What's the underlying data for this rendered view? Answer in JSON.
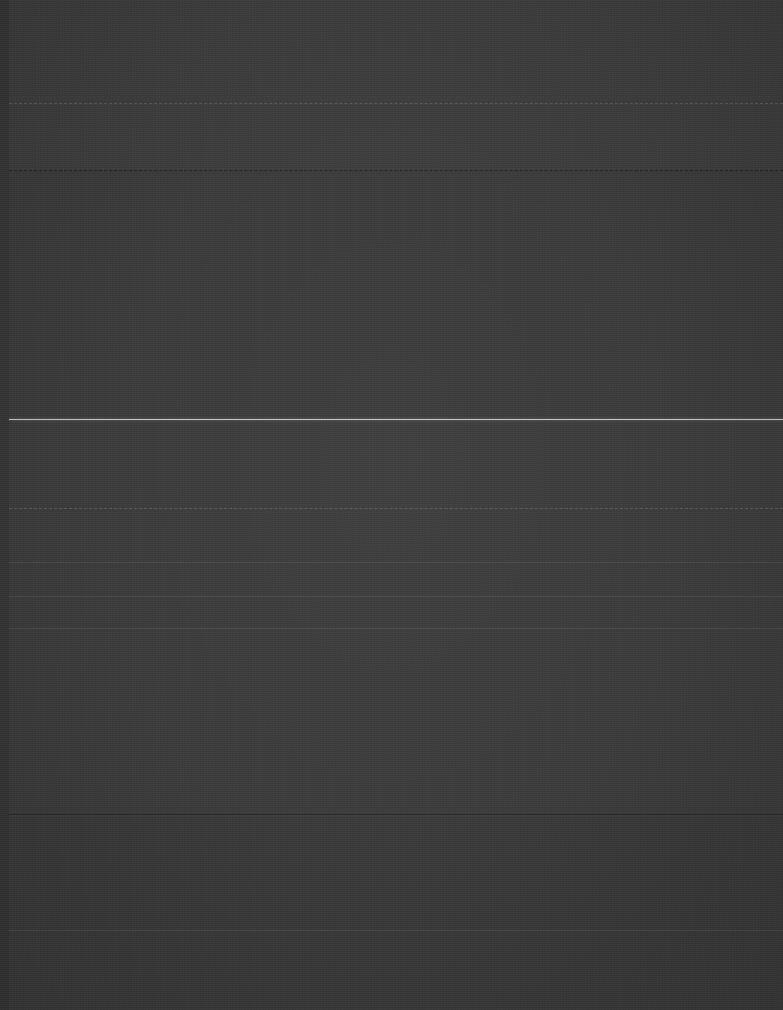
{
  "capture": {
    "width": 783,
    "height": 1010,
    "appearance": "very-dark",
    "legibility_note": "No text in this screenshot is legible; the image is severely underexposed.",
    "background_color": "#3a3a3a",
    "gutter_color": "#343434"
  },
  "colors": {
    "background": "#3a3a3a",
    "band_header": "#3b3b3b",
    "band_upper": "#393939",
    "band_mid": "#3a3a3a",
    "band_footer": "#383838",
    "divider_dark": "#232323",
    "rule_bright": "#c9c9c9",
    "gutter": "#343434"
  },
  "regions": [
    {
      "name": "header-band",
      "top": 0,
      "height": 170,
      "label": ""
    },
    {
      "name": "upper-band",
      "top": 171,
      "height": 248,
      "label": ""
    },
    {
      "name": "middle-band",
      "top": 420,
      "height": 395,
      "label": ""
    },
    {
      "name": "footer-band",
      "top": 816,
      "height": 194,
      "label": ""
    }
  ],
  "rules": [
    {
      "name": "faint-dashed-rule-top",
      "y": 103,
      "kind": "faint-dashed"
    },
    {
      "name": "dark-divider-upper",
      "y": 170,
      "kind": "dark-dashed"
    },
    {
      "name": "bright-separator-rule",
      "y": 419,
      "kind": "bright"
    },
    {
      "name": "faint-dashed-rule-mid",
      "y": 508,
      "kind": "faint-dashed"
    },
    {
      "name": "faint-rule-a",
      "y": 562,
      "kind": "faint"
    },
    {
      "name": "faint-rule-b",
      "y": 596,
      "kind": "faint"
    },
    {
      "name": "faint-rule-c",
      "y": 628,
      "kind": "faint"
    },
    {
      "name": "dark-divider-footer",
      "y": 814,
      "kind": "dark"
    },
    {
      "name": "faint-rule-d",
      "y": 930,
      "kind": "faint"
    }
  ],
  "text_rows": [
    {
      "y": 34,
      "x": 6,
      "text": "",
      "tone": "dimmer"
    },
    {
      "y": 58,
      "x": 6,
      "text": "",
      "tone": "dimmer"
    },
    {
      "y": 82,
      "x": 6,
      "text": "",
      "tone": "dimmer"
    },
    {
      "y": 103,
      "x": 6,
      "text": "",
      "tone": "dim"
    },
    {
      "y": 126,
      "x": 6,
      "text": "",
      "tone": "dimmer"
    },
    {
      "y": 150,
      "x": 6,
      "text": "",
      "tone": "dimmer"
    },
    {
      "y": 196,
      "x": 6,
      "text": "",
      "tone": "dimmer"
    },
    {
      "y": 222,
      "x": 6,
      "text": "",
      "tone": "dimmer"
    },
    {
      "y": 248,
      "x": 6,
      "text": "",
      "tone": "dim"
    },
    {
      "y": 262,
      "x": 6,
      "text": "",
      "tone": "dark"
    },
    {
      "y": 276,
      "x": 6,
      "text": "",
      "tone": "dim"
    },
    {
      "y": 290,
      "x": 6,
      "text": "",
      "tone": "dim"
    },
    {
      "y": 304,
      "x": 6,
      "text": "",
      "tone": "dim"
    },
    {
      "y": 318,
      "x": 6,
      "text": "",
      "tone": "dim"
    },
    {
      "y": 332,
      "x": 6,
      "text": "",
      "tone": "dimmer"
    },
    {
      "y": 352,
      "x": 6,
      "text": "",
      "tone": "dimmer"
    },
    {
      "y": 374,
      "x": 6,
      "text": "",
      "tone": "dimmer"
    },
    {
      "y": 396,
      "x": 6,
      "text": "",
      "tone": "dimmer"
    },
    {
      "y": 440,
      "x": 6,
      "text": "",
      "tone": "dimmer"
    },
    {
      "y": 464,
      "x": 6,
      "text": "",
      "tone": "dimmer"
    },
    {
      "y": 486,
      "x": 6,
      "text": "",
      "tone": "dimmer"
    },
    {
      "y": 508,
      "x": 6,
      "text": "",
      "tone": "dim"
    },
    {
      "y": 530,
      "x": 6,
      "text": "",
      "tone": "dimmer"
    },
    {
      "y": 562,
      "x": 6,
      "text": "",
      "tone": "dimmer"
    },
    {
      "y": 596,
      "x": 6,
      "text": "",
      "tone": "dimmer"
    },
    {
      "y": 628,
      "x": 6,
      "text": "",
      "tone": "dimmer"
    },
    {
      "y": 664,
      "x": 6,
      "text": "",
      "tone": "dimmer"
    },
    {
      "y": 700,
      "x": 6,
      "text": "",
      "tone": "dimmer"
    },
    {
      "y": 736,
      "x": 6,
      "text": "",
      "tone": "dimmer"
    },
    {
      "y": 772,
      "x": 6,
      "text": "",
      "tone": "dimmer"
    },
    {
      "y": 840,
      "x": 6,
      "text": "",
      "tone": "dimmer"
    },
    {
      "y": 876,
      "x": 6,
      "text": "",
      "tone": "dimmer"
    },
    {
      "y": 912,
      "x": 6,
      "text": "",
      "tone": "dimmer"
    },
    {
      "y": 950,
      "x": 6,
      "text": "",
      "tone": "dimmer"
    },
    {
      "y": 982,
      "x": 6,
      "text": "",
      "tone": "dimmer"
    }
  ]
}
